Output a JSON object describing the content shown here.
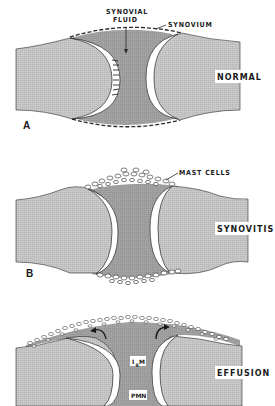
{
  "figure": {
    "colors": {
      "bone": "#c4c4c4",
      "fluid": "#9c9c9c",
      "cartilage": "#ffffff",
      "outline": "#2a2a2a",
      "background": "#ffffff"
    },
    "panels": [
      {
        "letter": "A",
        "state": "NORMAL",
        "annotations": [
          "SYNOVIAL",
          "FLUID",
          "SYNOVIUM"
        ]
      },
      {
        "letter": "B",
        "state": "SYNOVITIS",
        "annotations": [
          "MAST CELLS"
        ]
      },
      {
        "letter": "",
        "state": "EFFUSION",
        "annotations": [
          "I",
          "g",
          "M",
          "PMN"
        ]
      }
    ]
  }
}
